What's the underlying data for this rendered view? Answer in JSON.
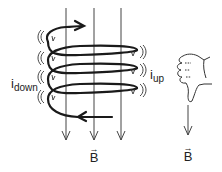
{
  "diagram": {
    "labels": {
      "current_left": {
        "main": "i",
        "sub": "down"
      },
      "current_right": {
        "main": "i",
        "sub": "up"
      },
      "field_coil": {
        "arrow": "→",
        "symbol": "B"
      },
      "field_hand": {
        "arrow": "→",
        "symbol": "B"
      }
    },
    "components": {
      "field_lines": 3,
      "coil_turns": 4,
      "hand_gesture": "thumb-down right hand"
    },
    "colors": {
      "stroke": "#222222",
      "field_line": "#333333",
      "background": "#ffffff"
    }
  }
}
